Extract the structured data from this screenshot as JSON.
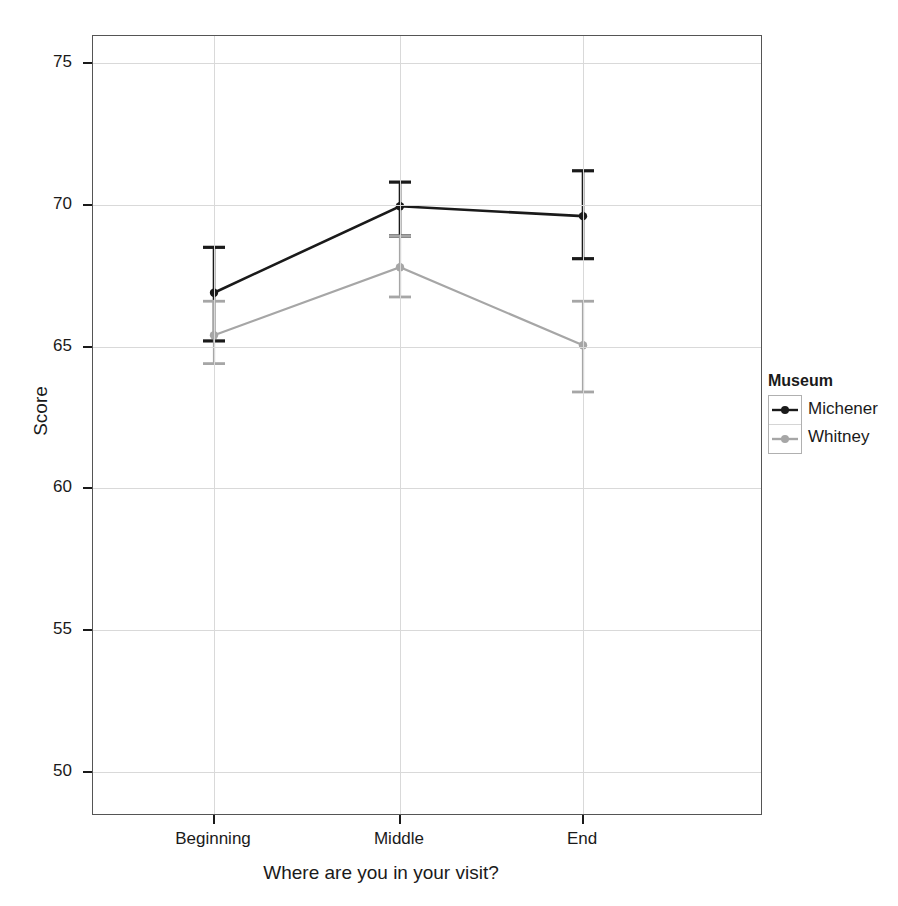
{
  "chart_data": {
    "type": "line",
    "title": "",
    "xlabel": "Where are you in your visit?",
    "ylabel": "Score",
    "categories": [
      "Beginning",
      "Middle",
      "End"
    ],
    "ylim": [
      48.5,
      76.5
    ],
    "yticks": [
      50,
      55,
      60,
      65,
      70,
      75
    ],
    "ytick_labels": [
      "50",
      "55",
      "60",
      "65",
      "70",
      "75"
    ],
    "grid": true,
    "grid_axis": "both",
    "legend_position": "right",
    "legend_title": "Museum",
    "error_bars": true,
    "series": [
      {
        "name": "Michener",
        "color": "#1a1a1a",
        "values": [
          66.9,
          69.95,
          69.6
        ],
        "err_low": [
          65.2,
          68.9,
          68.1
        ],
        "err_high": [
          68.5,
          70.8,
          71.2
        ]
      },
      {
        "name": "Whitney",
        "color": "#a6a6a6",
        "values": [
          65.4,
          67.8,
          65.05
        ],
        "err_low": [
          64.4,
          66.75,
          63.4
        ],
        "err_high": [
          66.6,
          68.9,
          66.6
        ]
      }
    ]
  },
  "axis": {
    "y_title": "Score",
    "x_title": "Where are you in your visit?",
    "y_tick_labels": [
      "75",
      "70",
      "65",
      "60",
      "55",
      "50"
    ],
    "x_tick_labels": [
      "Beginning",
      "Middle",
      "End"
    ]
  },
  "legend": {
    "title": "Museum",
    "entries": [
      {
        "label": "Michener",
        "color": "#1a1a1a"
      },
      {
        "label": "Whitney",
        "color": "#a6a6a6"
      }
    ]
  },
  "colors": {
    "series_michener": "#1a1a1a",
    "series_whitney": "#a6a6a6",
    "grid": "#d9d9d9",
    "frame": "#555555",
    "background": "#ffffff"
  }
}
